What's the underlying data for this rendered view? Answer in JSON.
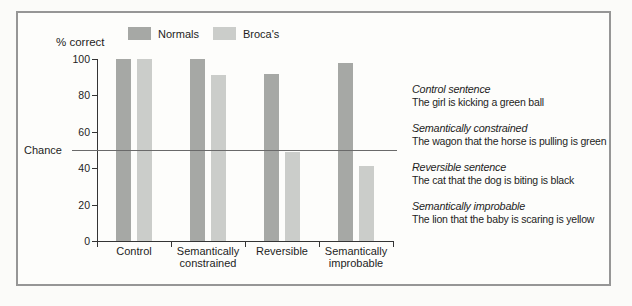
{
  "figure": {
    "chance_label": "Chance"
  },
  "chart_data": {
    "type": "bar",
    "title": "",
    "ylabel": "% correct",
    "xlabel": "",
    "categories": [
      "Control",
      "Semantically constrained",
      "Reversible",
      "Semantically improbable"
    ],
    "series": [
      {
        "name": "Normals",
        "values": [
          100,
          100,
          92,
          98
        ],
        "color": "#a6a8a5"
      },
      {
        "name": "Broca's",
        "values": [
          100,
          91,
          49,
          41
        ],
        "color": "#cbcdca"
      }
    ],
    "yticks": [
      0,
      20,
      40,
      60,
      80,
      100
    ],
    "ylim": [
      0,
      100
    ],
    "chance_line_value": 50,
    "grid": "off",
    "legend_position": "top"
  },
  "annotations": [
    {
      "title": "Control sentence",
      "sentence": "The girl is kicking a green ball"
    },
    {
      "title": "Semantically constrained",
      "sentence": "The wagon that the horse is pulling is green"
    },
    {
      "title": "Reversible sentence",
      "sentence": "The cat that the dog is biting is black"
    },
    {
      "title": "Semantically improbable",
      "sentence": "The lion that the baby is scaring is yellow"
    }
  ],
  "colors": {
    "normals_bar": "#a6a8a5",
    "brocas_bar": "#cbcdca",
    "frame_border": "#969696",
    "axis": "#343434",
    "chance_line": "#6a6a6a",
    "background": "#fbfbf9",
    "text": "#1d1d1d"
  }
}
